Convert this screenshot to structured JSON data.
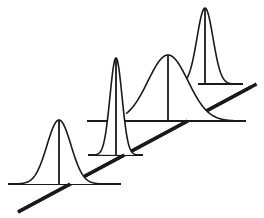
{
  "diagram": {
    "colors": {
      "ink": "#1a1a1a",
      "background": "#ffffff"
    },
    "axis": {
      "x1": 18,
      "y1": 212,
      "x2": 251,
      "y2": 87
    },
    "distributions": [
      {
        "id": "dist-1",
        "center_x": 59,
        "baseline_y": 184,
        "base_x1": 8,
        "base_x2": 121,
        "peak_y": 120,
        "sigma": 12,
        "tail_left": 12,
        "tail_right": 104
      },
      {
        "id": "dist-2",
        "center_x": 116,
        "baseline_y": 155,
        "base_x1": 88,
        "base_x2": 143,
        "peak_y": 58,
        "sigma": 6,
        "tail_left": 96,
        "tail_right": 138
      },
      {
        "id": "dist-3",
        "center_x": 168,
        "baseline_y": 121,
        "base_x1": 87,
        "base_x2": 246,
        "peak_y": 55,
        "sigma": 20,
        "tail_left": 126,
        "tail_right": 236
      },
      {
        "id": "dist-4",
        "center_x": 205,
        "baseline_y": 84,
        "base_x1": 198,
        "base_x2": 243,
        "peak_y": 8,
        "sigma": 8,
        "tail_left": 186,
        "tail_right": 238
      }
    ]
  }
}
